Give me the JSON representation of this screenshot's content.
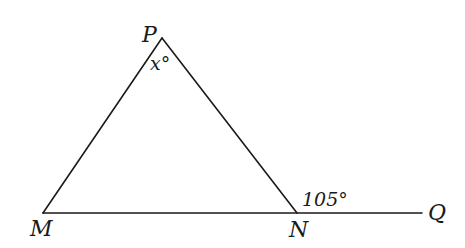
{
  "diagram": {
    "type": "geometry-triangle",
    "points": {
      "P": {
        "label": "P",
        "x": 162,
        "y": 38
      },
      "M": {
        "label": "M",
        "x": 43,
        "y": 213
      },
      "N": {
        "label": "N",
        "x": 297,
        "y": 213
      },
      "Q": {
        "label": "Q",
        "x": 422,
        "y": 213
      }
    },
    "segments": [
      "PM",
      "PN",
      "MN",
      "NQ"
    ],
    "angles": {
      "at_P": {
        "label": "x°",
        "vertex": "P",
        "description": "interior angle MPN"
      },
      "at_N": {
        "label": "105°",
        "vertex": "N",
        "description": "exterior angle PNQ"
      }
    },
    "stroke_color": "#1a1a1a"
  }
}
